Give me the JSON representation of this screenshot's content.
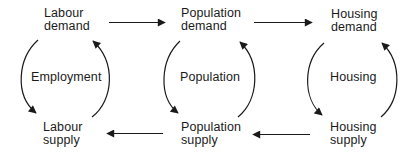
{
  "diagram": {
    "nodes": {
      "labour_demand": {
        "line1": "Labour",
        "line2": "demand"
      },
      "population_demand": {
        "line1": "Population",
        "line2": "demand"
      },
      "housing_demand": {
        "line1": "Housing",
        "line2": "demand"
      },
      "labour_supply": {
        "line1": "Labour",
        "line2": "supply"
      },
      "population_supply": {
        "line1": "Population",
        "line2": "supply"
      },
      "housing_supply": {
        "line1": "Housing",
        "line2": "supply"
      }
    },
    "cycles": {
      "employment": "Employment",
      "population": "Population",
      "housing": "Housing"
    },
    "edges": [
      {
        "from": "Labour demand",
        "to": "Population demand",
        "direction": "right"
      },
      {
        "from": "Population demand",
        "to": "Housing demand",
        "direction": "right"
      },
      {
        "from": "Housing supply",
        "to": "Population supply",
        "direction": "left"
      },
      {
        "from": "Population supply",
        "to": "Labour supply",
        "direction": "left"
      },
      {
        "from": "Labour demand",
        "to": "Labour supply",
        "via": "Employment cycle"
      },
      {
        "from": "Labour supply",
        "to": "Labour demand",
        "via": "Employment cycle"
      },
      {
        "from": "Population demand",
        "to": "Population supply",
        "via": "Population cycle"
      },
      {
        "from": "Population supply",
        "to": "Population demand",
        "via": "Population cycle"
      },
      {
        "from": "Housing demand",
        "to": "Housing supply",
        "via": "Housing cycle"
      },
      {
        "from": "Housing supply",
        "to": "Housing demand",
        "via": "Housing cycle"
      }
    ],
    "colors": {
      "stroke": "#1a1a1a",
      "background": "#ffffff"
    }
  }
}
